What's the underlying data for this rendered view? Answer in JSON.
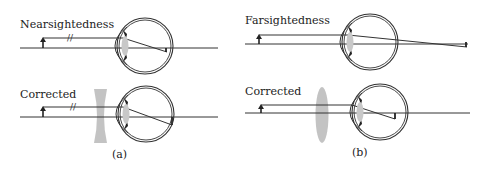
{
  "figure": {
    "panel_a": {
      "caption": "(a)",
      "top": {
        "label": "Nearsightedness",
        "break_mark": "//"
      },
      "bottom": {
        "label": "Corrected",
        "break_mark": "//",
        "lens_type": "concave"
      }
    },
    "panel_b": {
      "caption": "(b)",
      "top": {
        "label": "Farsightedness"
      },
      "bottom": {
        "label": "Corrected",
        "lens_type": "convex"
      }
    }
  },
  "colors": {
    "line": "#333333",
    "lens": "#b8b8b8",
    "eye_lens": "#c8c8c8",
    "background": "#ffffff"
  }
}
